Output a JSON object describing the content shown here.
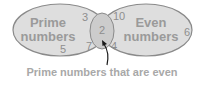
{
  "diagram": {
    "type": "venn",
    "sets": [
      {
        "label_line1": "Prime",
        "label_line2": "numbers",
        "only_members": [
          "3",
          "5",
          "7"
        ]
      },
      {
        "label_line1": "Even",
        "label_line2": "numbers",
        "only_members": [
          "10",
          "6",
          "4"
        ]
      }
    ],
    "intersection": {
      "members": [
        "2"
      ]
    },
    "annotation": "Prime numbers that are even",
    "colors": {
      "fill": "#dcdcdc",
      "outline": "#8a8a8a",
      "intersection_fill": "#c8c8c8",
      "text": "#9a9a9a",
      "arrow": "#1a1a1a"
    }
  }
}
